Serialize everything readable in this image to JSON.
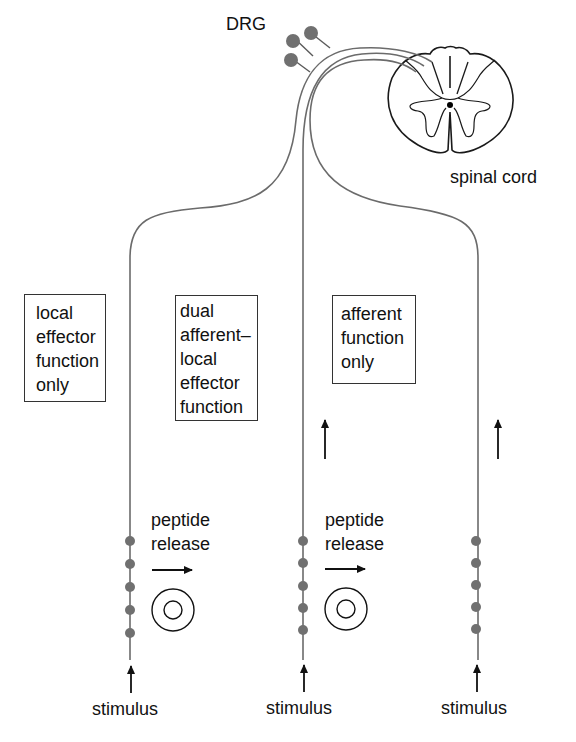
{
  "labels": {
    "drg": "DRG",
    "spinal_cord": "spinal cord",
    "stimulus": [
      "stimulus",
      "stimulus",
      "stimulus"
    ],
    "peptide_release": [
      {
        "line1": "peptide",
        "line2": "release"
      },
      {
        "line1": "peptide",
        "line2": "release"
      }
    ]
  },
  "boxes": [
    {
      "id": "left",
      "lines": [
        "local",
        "effector",
        "function",
        "only"
      ]
    },
    {
      "id": "middle",
      "lines": [
        "dual",
        "afferent–",
        "local",
        "effector",
        "function"
      ]
    },
    {
      "id": "right",
      "lines": [
        "afferent",
        "function",
        "only"
      ]
    }
  ],
  "colors": {
    "fiber": "#6b6b6b",
    "soma": "#707070",
    "varicosity": "#707070",
    "outline": "#1a1a1a",
    "text": "#111111"
  },
  "fibers": [
    {
      "name": "local effector",
      "x": 130,
      "varicosities": 5
    },
    {
      "name": "dual",
      "x": 303,
      "varicosities": 5
    },
    {
      "name": "afferent",
      "x": 478,
      "varicosities": 5
    }
  ]
}
